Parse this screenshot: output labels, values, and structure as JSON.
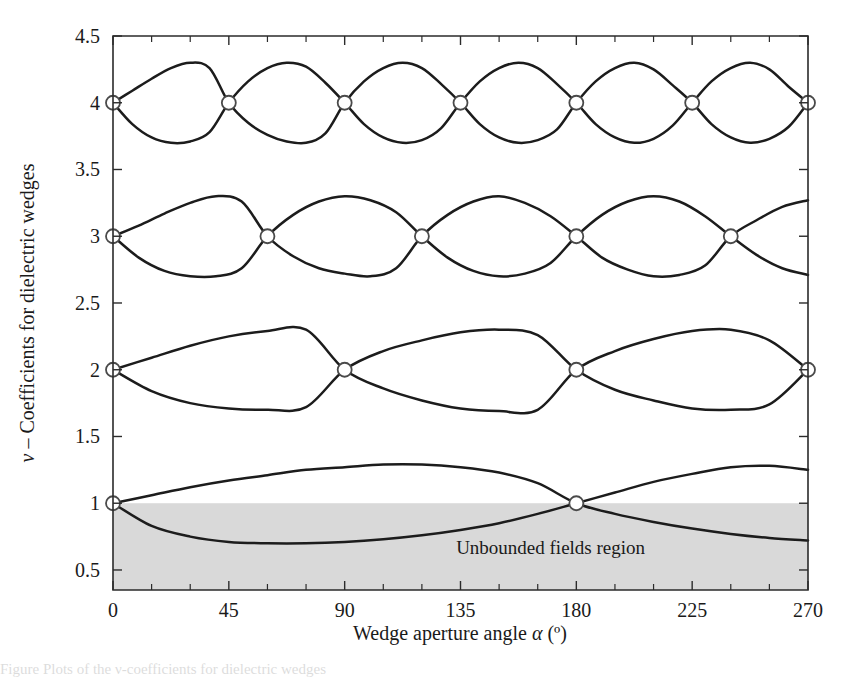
{
  "figure": {
    "background_color": "#ffffff",
    "curve_color": "#1c1c1c",
    "shade_color": "#d9d9d9",
    "marker_fill": "#ffffff",
    "marker_stroke": "#4a4a4a"
  },
  "axes": {
    "x_title_prefix": "Wedge aperture angle ",
    "x_title_symbol": "α",
    "x_title_suffix": " (º)",
    "y_title_symbol": "ν",
    "y_title_text": " – Coefficients for dielectric wedges",
    "x_ticks": [
      "0",
      "45",
      "90",
      "135",
      "180",
      "225",
      "270"
    ],
    "y_ticks": [
      "0.5",
      "1",
      "1.5",
      "2",
      "2.5",
      "3",
      "3.5",
      "4",
      "4.5"
    ]
  },
  "annotations": {
    "unbounded_region_label": "Unbounded fields region"
  },
  "caption": {
    "text": "Figure   Plots of the ν-coefficients for dielectric wedges"
  },
  "chart_data": {
    "type": "line",
    "title": "",
    "xlabel": "Wedge aperture angle α (º)",
    "ylabel": "ν – Coefficients for dielectric wedges",
    "xlim": [
      0,
      270
    ],
    "ylim": [
      0.35,
      4.5
    ],
    "xtick_values": [
      0,
      45,
      90,
      135,
      180,
      225,
      270
    ],
    "xtick_minor_step": 15,
    "ytick_values": [
      0.5,
      1,
      1.5,
      2,
      2.5,
      3,
      3.5,
      4,
      4.5
    ],
    "grid": false,
    "legend": null,
    "shaded_regions": [
      {
        "name": "Unbounded fields region",
        "y_from": 0.35,
        "y_to": 1.0,
        "color": "#d9d9d9",
        "label": "Unbounded fields region",
        "label_x": 170,
        "label_y": 0.62
      }
    ],
    "series": [
      {
        "name": "nu = 1 (upper branch)",
        "family": 1,
        "branch": "upper",
        "amplitude": 0.29,
        "base": 1.0,
        "crossing_period_deg": 180,
        "x": [
          0,
          15,
          30,
          45,
          60,
          75,
          90,
          105,
          120,
          135,
          150,
          165,
          180,
          195,
          210,
          225,
          240,
          255,
          270
        ],
        "y": [
          1.0,
          1.06,
          1.12,
          1.17,
          1.21,
          1.25,
          1.27,
          1.29,
          1.29,
          1.27,
          1.23,
          1.15,
          1.0,
          0.92,
          0.86,
          0.81,
          0.77,
          0.74,
          0.72
        ]
      },
      {
        "name": "nu = 1 (lower branch)",
        "family": 1,
        "branch": "lower",
        "amplitude": 0.29,
        "base": 1.0,
        "crossing_period_deg": 180,
        "x": [
          0,
          15,
          30,
          45,
          60,
          75,
          90,
          105,
          120,
          135,
          150,
          165,
          180,
          195,
          210,
          225,
          240,
          255,
          270
        ],
        "y": [
          1.0,
          0.83,
          0.75,
          0.71,
          0.7,
          0.7,
          0.71,
          0.73,
          0.76,
          0.8,
          0.85,
          0.92,
          1.0,
          1.08,
          1.16,
          1.22,
          1.27,
          1.28,
          1.25
        ]
      },
      {
        "name": "nu = 2 (upper branch)",
        "family": 2,
        "branch": "upper",
        "amplitude": 0.3,
        "base": 2.0,
        "crossing_period_deg": 90,
        "x": [
          0,
          15,
          30,
          45,
          60,
          75,
          90,
          105,
          120,
          135,
          150,
          165,
          180,
          195,
          210,
          225,
          240,
          255,
          270
        ],
        "y": [
          2.0,
          2.09,
          2.18,
          2.25,
          2.29,
          2.3,
          2.0,
          1.86,
          1.77,
          1.71,
          1.69,
          1.7,
          2.0,
          2.14,
          2.23,
          2.29,
          2.3,
          2.22,
          2.0
        ]
      },
      {
        "name": "nu = 2 (lower branch)",
        "family": 2,
        "branch": "lower",
        "amplitude": 0.3,
        "base": 2.0,
        "crossing_period_deg": 90,
        "x": [
          0,
          15,
          30,
          45,
          60,
          75,
          90,
          105,
          120,
          135,
          150,
          165,
          180,
          195,
          210,
          225,
          240,
          255,
          270
        ],
        "y": [
          2.0,
          1.84,
          1.75,
          1.71,
          1.7,
          1.72,
          2.0,
          2.14,
          2.22,
          2.28,
          2.3,
          2.26,
          2.0,
          1.85,
          1.77,
          1.71,
          1.7,
          1.74,
          2.0
        ]
      },
      {
        "name": "nu = 3 (upper branch)",
        "family": 3,
        "branch": "upper",
        "amplitude": 0.3,
        "base": 3.0,
        "crossing_period_deg": 60,
        "x": [
          0,
          10,
          20,
          30,
          40,
          50,
          60,
          70,
          80,
          90,
          100,
          110,
          120,
          130,
          140,
          150,
          160,
          170,
          180,
          190,
          200,
          210,
          220,
          230,
          240,
          250,
          260,
          270
        ],
        "y": [
          3.0,
          3.08,
          3.17,
          3.25,
          3.3,
          3.26,
          3.0,
          2.85,
          2.76,
          2.72,
          2.7,
          2.76,
          3.0,
          3.16,
          3.26,
          3.3,
          3.25,
          3.15,
          3.0,
          2.84,
          2.75,
          2.7,
          2.71,
          2.78,
          3.0,
          3.12,
          3.22,
          3.27
        ]
      },
      {
        "name": "nu = 3 (lower branch)",
        "family": 3,
        "branch": "lower",
        "amplitude": 0.3,
        "base": 3.0,
        "crossing_period_deg": 60,
        "x": [
          0,
          10,
          20,
          30,
          40,
          50,
          60,
          70,
          80,
          90,
          100,
          110,
          120,
          130,
          140,
          150,
          160,
          170,
          180,
          190,
          200,
          210,
          220,
          230,
          240,
          250,
          260,
          270
        ],
        "y": [
          3.0,
          2.84,
          2.74,
          2.7,
          2.7,
          2.76,
          3.0,
          3.16,
          3.26,
          3.3,
          3.27,
          3.18,
          3.0,
          2.84,
          2.74,
          2.7,
          2.72,
          2.8,
          3.0,
          3.16,
          3.26,
          3.3,
          3.26,
          3.15,
          3.0,
          2.86,
          2.76,
          2.71
        ]
      },
      {
        "name": "nu = 4 (upper branch)",
        "family": 4,
        "branch": "upper",
        "amplitude": 0.3,
        "base": 4.0,
        "crossing_period_deg": 45,
        "x": [
          0,
          7.5,
          15,
          22.5,
          30,
          37.5,
          45,
          52.5,
          60,
          67.5,
          75,
          82.5,
          90,
          97.5,
          105,
          112.5,
          120,
          127.5,
          135,
          142.5,
          150,
          157.5,
          165,
          172.5,
          180,
          187.5,
          195,
          202.5,
          210,
          217.5,
          225,
          232.5,
          240,
          247.5,
          255,
          262.5,
          270
        ],
        "y": [
          4.0,
          4.09,
          4.18,
          4.26,
          4.3,
          4.26,
          4.0,
          3.85,
          3.76,
          3.71,
          3.7,
          3.77,
          4.0,
          4.16,
          4.26,
          4.3,
          4.26,
          4.14,
          4.0,
          3.84,
          3.74,
          3.7,
          3.72,
          3.8,
          4.0,
          4.16,
          4.26,
          4.3,
          4.25,
          4.13,
          4.0,
          3.84,
          3.74,
          3.7,
          3.73,
          3.82,
          4.0
        ]
      },
      {
        "name": "nu = 4 (lower branch)",
        "family": 4,
        "branch": "lower",
        "amplitude": 0.3,
        "base": 4.0,
        "crossing_period_deg": 45,
        "x": [
          0,
          7.5,
          15,
          22.5,
          30,
          37.5,
          45,
          52.5,
          60,
          67.5,
          75,
          82.5,
          90,
          97.5,
          105,
          112.5,
          120,
          127.5,
          135,
          142.5,
          150,
          157.5,
          165,
          172.5,
          180,
          187.5,
          195,
          202.5,
          210,
          217.5,
          225,
          232.5,
          240,
          247.5,
          255,
          262.5,
          270
        ],
        "y": [
          4.0,
          3.84,
          3.74,
          3.7,
          3.71,
          3.78,
          4.0,
          4.16,
          4.26,
          4.3,
          4.27,
          4.15,
          4.0,
          3.84,
          3.74,
          3.7,
          3.72,
          3.81,
          4.0,
          4.16,
          4.26,
          4.3,
          4.26,
          4.14,
          4.0,
          3.84,
          3.74,
          3.7,
          3.73,
          3.83,
          4.0,
          4.16,
          4.26,
          4.3,
          4.25,
          4.12,
          4.0
        ]
      }
    ],
    "crossing_markers": [
      {
        "x": 0,
        "y": 1
      },
      {
        "x": 180,
        "y": 1
      },
      {
        "x": 0,
        "y": 2
      },
      {
        "x": 90,
        "y": 2
      },
      {
        "x": 180,
        "y": 2
      },
      {
        "x": 270,
        "y": 2
      },
      {
        "x": 0,
        "y": 3
      },
      {
        "x": 60,
        "y": 3
      },
      {
        "x": 120,
        "y": 3
      },
      {
        "x": 180,
        "y": 3
      },
      {
        "x": 240,
        "y": 3
      },
      {
        "x": 0,
        "y": 4
      },
      {
        "x": 45,
        "y": 4
      },
      {
        "x": 90,
        "y": 4
      },
      {
        "x": 135,
        "y": 4
      },
      {
        "x": 180,
        "y": 4
      },
      {
        "x": 225,
        "y": 4
      },
      {
        "x": 270,
        "y": 4
      }
    ]
  }
}
